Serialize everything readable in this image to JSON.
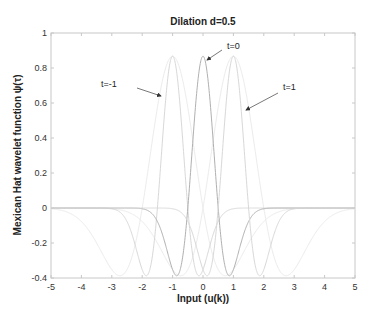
{
  "chart_data": {
    "type": "line",
    "title": "Dilation d=0.5",
    "xlabel": "Input (u(k))",
    "ylabel": "Mexican Hat wavelet function   ψ(τ)",
    "xlim": [
      -5,
      5
    ],
    "ylim": [
      -0.4,
      1
    ],
    "xticks": [
      -5,
      -4,
      -3,
      -2,
      -1,
      0,
      1,
      2,
      3,
      4,
      5
    ],
    "xtick_labels": [
      "-5",
      "-4",
      "-3",
      "-2",
      "-1",
      "0",
      "1",
      "2",
      "3",
      "4",
      "5"
    ],
    "yticks": [
      -0.4,
      -0.2,
      0,
      0.2,
      0.4,
      0.6,
      0.8,
      1
    ],
    "ytick_labels": [
      "-0.4",
      "-0.2",
      "0",
      "0.2",
      "0.4",
      "0.6",
      "0.8",
      "1"
    ],
    "grid": false,
    "legend": null,
    "dilation": 0.5,
    "series": [
      {
        "name": "t=-1",
        "translation": -1,
        "color": "#d8d8d8",
        "peak": {
          "x": -1,
          "y": 0.867
        },
        "minima": [
          {
            "x": -1.87,
            "y": -0.387
          },
          {
            "x": -0.13,
            "y": -0.387
          }
        ]
      },
      {
        "name": "t=0",
        "translation": 0,
        "color": "#b0b0b0",
        "peak": {
          "x": 0,
          "y": 0.867
        },
        "minima": [
          {
            "x": -0.87,
            "y": -0.387
          },
          {
            "x": 0.87,
            "y": -0.387
          }
        ]
      },
      {
        "name": "t=1",
        "translation": 1,
        "color": "#d8d8d8",
        "peak": {
          "x": 1,
          "y": 0.867
        },
        "minima": [
          {
            "x": 0.13,
            "y": -0.387
          },
          {
            "x": 1.87,
            "y": -0.387
          }
        ]
      },
      {
        "name": "baseline (wide)",
        "translation": 0,
        "color": "#e4e4e4",
        "note": "faint zero/background curves spanning -3..3"
      }
    ],
    "annotations": [
      {
        "text": "t=-1",
        "arrow_to": {
          "x": -1.25,
          "y": 0.65
        }
      },
      {
        "text": "t=0",
        "arrow_to": {
          "x": 0.05,
          "y": 0.85
        }
      },
      {
        "text": "t=1",
        "arrow_to": {
          "x": 1.3,
          "y": 0.57
        }
      }
    ]
  }
}
